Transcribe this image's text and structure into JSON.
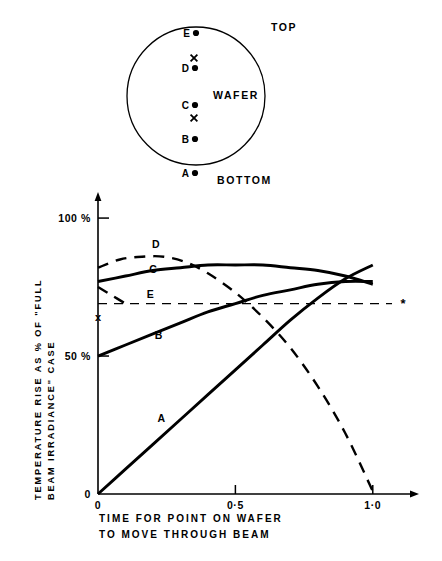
{
  "figure": {
    "wafer_diagram": {
      "title_top": "TOP",
      "title_bottom": "BOTTOM",
      "wafer_label": "WAFER",
      "points": [
        {
          "label": "E",
          "marker": "dot",
          "cx": 196,
          "cy": 33
        },
        {
          "label": "",
          "marker": "cross",
          "cx": 194,
          "cy": 58
        },
        {
          "label": "D",
          "marker": "dot",
          "cx": 195,
          "cy": 68
        },
        {
          "label": "C",
          "marker": "dot",
          "cx": 195,
          "cy": 105
        },
        {
          "label": "",
          "marker": "cross",
          "cx": 194,
          "cy": 118
        },
        {
          "label": "B",
          "marker": "dot",
          "cx": 195,
          "cy": 139
        },
        {
          "label": "A",
          "marker": "dot",
          "cx": 195,
          "cy": 173
        }
      ],
      "circle": {
        "cx": 196,
        "cy": 96,
        "r": 69
      }
    },
    "chart_marker_asterisk": "*",
    "chart_axis_cross": "x"
  },
  "chart_data": {
    "type": "line",
    "title": "",
    "ylabel_line1": "TEMPERATURE RISE AS % OF \"FULL",
    "ylabel_line2": "BEAM IRRADIANCE\" CASE",
    "xlabel_line1": "TIME FOR POINT ON WAFER",
    "xlabel_line2": "TO MOVE THROUGH BEAM",
    "xlim": [
      0,
      1.15
    ],
    "ylim": [
      0,
      108
    ],
    "xticks": [
      0,
      0.5,
      1.0
    ],
    "xticklabels": [
      "0",
      "0·0",
      "1·0"
    ],
    "xticklabels_display": [
      "0",
      "0·5",
      "1·0"
    ],
    "yticks": [
      0,
      50,
      100
    ],
    "yticklabels": [
      "0",
      "50 %",
      "100 %"
    ],
    "grid": false,
    "legend": "inline-curve-labels",
    "reference_line": {
      "label": "E",
      "style": "dashed",
      "y": 69,
      "x_start": 0,
      "x_end": 1.07,
      "end_marker": "*"
    },
    "axis_marker": {
      "label": "x",
      "x": 0,
      "y": 64
    },
    "series": [
      {
        "name": "A",
        "style": "solid",
        "label_x": 0.23,
        "label_y": 26,
        "points": [
          {
            "x": 0.0,
            "y": 0
          },
          {
            "x": 0.1,
            "y": 9
          },
          {
            "x": 0.2,
            "y": 18
          },
          {
            "x": 0.3,
            "y": 27
          },
          {
            "x": 0.4,
            "y": 36
          },
          {
            "x": 0.5,
            "y": 45
          },
          {
            "x": 0.6,
            "y": 54
          },
          {
            "x": 0.7,
            "y": 63
          },
          {
            "x": 0.8,
            "y": 71
          },
          {
            "x": 0.9,
            "y": 78
          },
          {
            "x": 1.0,
            "y": 83
          }
        ]
      },
      {
        "name": "B",
        "style": "solid",
        "label_x": 0.22,
        "label_y": 56,
        "points": [
          {
            "x": 0.0,
            "y": 50
          },
          {
            "x": 0.1,
            "y": 54
          },
          {
            "x": 0.2,
            "y": 58
          },
          {
            "x": 0.3,
            "y": 62
          },
          {
            "x": 0.4,
            "y": 66
          },
          {
            "x": 0.5,
            "y": 69
          },
          {
            "x": 0.6,
            "y": 72
          },
          {
            "x": 0.7,
            "y": 74
          },
          {
            "x": 0.8,
            "y": 76
          },
          {
            "x": 0.9,
            "y": 77
          },
          {
            "x": 1.0,
            "y": 77
          }
        ]
      },
      {
        "name": "C",
        "style": "solid",
        "label_x": 0.2,
        "label_y": 80,
        "points": [
          {
            "x": 0.0,
            "y": 77
          },
          {
            "x": 0.1,
            "y": 79
          },
          {
            "x": 0.2,
            "y": 81
          },
          {
            "x": 0.3,
            "y": 82
          },
          {
            "x": 0.4,
            "y": 83
          },
          {
            "x": 0.5,
            "y": 83
          },
          {
            "x": 0.6,
            "y": 83
          },
          {
            "x": 0.7,
            "y": 82
          },
          {
            "x": 0.8,
            "y": 81
          },
          {
            "x": 0.9,
            "y": 79
          },
          {
            "x": 1.0,
            "y": 76
          }
        ]
      },
      {
        "name": "D",
        "style": "dashed",
        "label_x": 0.21,
        "label_y": 89,
        "points": [
          {
            "x": 0.0,
            "y": 82
          },
          {
            "x": 0.08,
            "y": 85
          },
          {
            "x": 0.16,
            "y": 86
          },
          {
            "x": 0.24,
            "y": 86
          },
          {
            "x": 0.32,
            "y": 84
          },
          {
            "x": 0.4,
            "y": 80
          },
          {
            "x": 0.5,
            "y": 73
          },
          {
            "x": 0.6,
            "y": 64
          },
          {
            "x": 0.7,
            "y": 53
          },
          {
            "x": 0.8,
            "y": 39
          },
          {
            "x": 0.9,
            "y": 22
          },
          {
            "x": 1.0,
            "y": 1
          }
        ]
      },
      {
        "name": "E-lower-stub",
        "style": "dashed",
        "label_x": null,
        "label_y": null,
        "points": [
          {
            "x": 0.0,
            "y": 75
          },
          {
            "x": 0.05,
            "y": 72
          },
          {
            "x": 0.1,
            "y": 69
          }
        ]
      }
    ]
  }
}
